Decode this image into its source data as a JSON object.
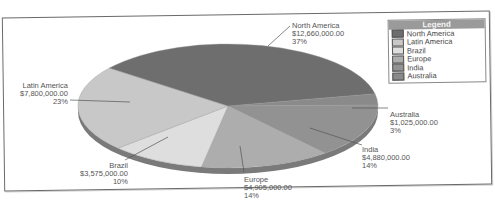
{
  "chart_data": {
    "type": "pie",
    "title": "",
    "legend_title": "Legend",
    "legend_position": "top-right",
    "categories": [
      "North America",
      "Latin America",
      "Brazil",
      "Europe",
      "India",
      "Australia"
    ],
    "values": [
      12660000,
      7800000,
      3575000,
      4905000,
      4880000,
      1025000
    ],
    "value_labels": [
      "$12,660,000.00",
      "$7,800,000.00",
      "$3,575,000.00",
      "$4,905,000.00",
      "$4,880,000.00",
      "$1,025,000.00"
    ],
    "percent_labels": [
      "37%",
      "23%",
      "10%",
      "14%",
      "14%",
      "3%"
    ],
    "colors": [
      "#6e6e6e",
      "#c8c8c8",
      "#dedede",
      "#adadad",
      "#929292",
      "#8a8a8a"
    ],
    "style": "3d-tilted"
  },
  "legend": {
    "title": "Legend",
    "items": [
      {
        "label": "North America",
        "color": "#6e6e6e"
      },
      {
        "label": "Latin America",
        "color": "#c8c8c8"
      },
      {
        "label": "Brazil",
        "color": "#dedede"
      },
      {
        "label": "Europe",
        "color": "#adadad"
      },
      {
        "label": "India",
        "color": "#929292"
      },
      {
        "label": "Australia",
        "color": "#8a8a8a"
      }
    ]
  },
  "labels": {
    "north_america": {
      "name": "North America",
      "value": "$12,660,000.00",
      "pct": "37%"
    },
    "latin_america": {
      "name": "Latin America",
      "value": "$7,800,000.00",
      "pct": "23%"
    },
    "brazil": {
      "name": "Brazil",
      "value": "$3,575,000.00",
      "pct": "10%"
    },
    "europe": {
      "name": "Europe",
      "value": "$4,905,000.00",
      "pct": "14%"
    },
    "india": {
      "name": "India",
      "value": "$4,880,000.00",
      "pct": "14%"
    },
    "australia": {
      "name": "Australia",
      "value": "$1,025,000.00",
      "pct": "3%"
    }
  }
}
